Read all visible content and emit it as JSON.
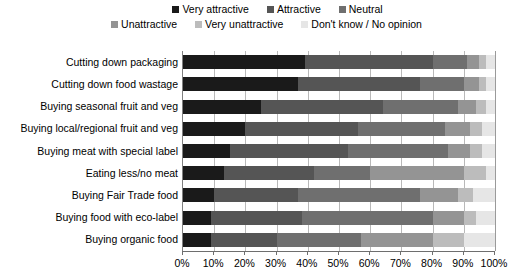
{
  "chart_data": {
    "type": "bar",
    "orientation": "horizontal",
    "stacked": true,
    "title": "",
    "xlabel": "",
    "ylabel": "",
    "xlim": [
      0,
      100
    ],
    "xticks": [
      "0%",
      "10%",
      "20%",
      "30%",
      "40%",
      "50%",
      "60%",
      "70%",
      "80%",
      "90%",
      "100%"
    ],
    "grid": true,
    "legend_position": "top",
    "categories": [
      "Cutting down packaging",
      "Cutting down food wastage",
      "Buying seasonal fruit and veg",
      "Buying local/regional fruit and veg",
      "Buying meat with special label",
      "Eating less/no meat",
      "Buying Fair Trade food",
      "Buying food with eco-label",
      "Buying organic food"
    ],
    "series": [
      {
        "name": "Very attractive",
        "color": "#1a1a1a",
        "values": [
          39,
          37,
          25,
          20,
          15,
          13,
          10,
          9,
          9
        ]
      },
      {
        "name": "Attractive",
        "color": "#555555",
        "values": [
          41,
          39,
          39,
          36,
          38,
          29,
          27,
          29,
          21
        ]
      },
      {
        "name": "Neutral",
        "color": "#6f6f6f",
        "values": [
          11,
          14,
          24,
          28,
          32,
          18,
          39,
          42,
          27
        ]
      },
      {
        "name": "Unattractive",
        "color": "#949494",
        "values": [
          4,
          5,
          6,
          8,
          7,
          30,
          12,
          10,
          23
        ]
      },
      {
        "name": "Very unattractive",
        "color": "#bcbcbc",
        "values": [
          2,
          2,
          3,
          4,
          4,
          7,
          5,
          4,
          10
        ]
      },
      {
        "name": "Don't know / No opinion",
        "color": "#e6e6e6",
        "values": [
          3,
          3,
          3,
          4,
          4,
          3,
          7,
          6,
          10
        ]
      }
    ]
  }
}
